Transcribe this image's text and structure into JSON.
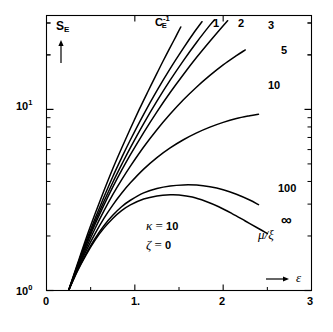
{
  "figure": {
    "background": "#ffffff",
    "ink_color": "#000000"
  },
  "axes": {
    "y_axis_name": "S",
    "y_axis_name_sub": "E",
    "y_axis_arrow": "↑",
    "x_axis_arrow": "→",
    "x_axis_name": "ε",
    "x_ticks": [
      "0",
      "1.",
      "2",
      "3"
    ],
    "y_ticks": [
      "10",
      "10"
    ],
    "y_tick_exponents": [
      "0",
      "1"
    ]
  },
  "annotations": {
    "kappa_line": "κ",
    "kappa_eq": " = ",
    "kappa_value": "10",
    "zeta_line": "ζ",
    "zeta_eq": " = ",
    "zeta_value": "0",
    "family_label_mu": "μ",
    "family_label_slash": "/",
    "family_label_xi": "ξ"
  },
  "curve_labels": {
    "ce_inv_base": "C",
    "ce_inv_sub": "E",
    "ce_inv_sup": "-1",
    "one": "1",
    "two": "2",
    "three": "3",
    "five": "5",
    "ten": "10",
    "hundred": "100",
    "infinity": "∞"
  },
  "chart_data": {
    "type": "line",
    "title": "",
    "xlabel": "ε",
    "ylabel": "S_E",
    "xscale": "linear",
    "yscale": "log",
    "xlim": [
      0,
      3
    ],
    "ylim": [
      1,
      33
    ],
    "grid": false,
    "legend": "inline curve end labels",
    "x_tick_values": [
      0,
      1,
      2,
      3
    ],
    "y_tick_values": [
      1,
      10
    ],
    "parameters": {
      "kappa": 10,
      "zeta": 0,
      "family_variable": "mu/xi"
    },
    "common_origin": {
      "x": 0.25,
      "y": 1.0
    },
    "series": [
      {
        "name": "C_E^-1",
        "label": "C_E^{-1}",
        "mu_over_xi": null,
        "points": [
          [
            0.25,
            1.0
          ],
          [
            0.35,
            1.4
          ],
          [
            0.45,
            1.95
          ],
          [
            0.55,
            2.65
          ],
          [
            0.65,
            3.55
          ],
          [
            0.75,
            4.7
          ],
          [
            0.85,
            6.1
          ],
          [
            0.95,
            7.85
          ],
          [
            1.05,
            10.0
          ],
          [
            1.15,
            12.6
          ],
          [
            1.25,
            15.8
          ],
          [
            1.32,
            18.5
          ],
          [
            1.4,
            22.0
          ],
          [
            1.46,
            25.0
          ],
          [
            1.52,
            28.5
          ]
        ]
      },
      {
        "name": "1",
        "label": "1",
        "mu_over_xi": 1,
        "points": [
          [
            0.25,
            1.0
          ],
          [
            0.35,
            1.38
          ],
          [
            0.45,
            1.88
          ],
          [
            0.55,
            2.5
          ],
          [
            0.65,
            3.28
          ],
          [
            0.75,
            4.25
          ],
          [
            0.85,
            5.4
          ],
          [
            0.95,
            6.8
          ],
          [
            1.1,
            9.4
          ],
          [
            1.25,
            12.7
          ],
          [
            1.4,
            16.8
          ],
          [
            1.55,
            21.8
          ],
          [
            1.68,
            27.0
          ],
          [
            1.76,
            30.5
          ]
        ]
      },
      {
        "name": "2",
        "label": "2",
        "mu_over_xi": 2,
        "points": [
          [
            0.25,
            1.0
          ],
          [
            0.35,
            1.36
          ],
          [
            0.45,
            1.82
          ],
          [
            0.55,
            2.4
          ],
          [
            0.65,
            3.1
          ],
          [
            0.75,
            3.95
          ],
          [
            0.85,
            4.95
          ],
          [
            0.95,
            6.15
          ],
          [
            1.1,
            8.35
          ],
          [
            1.25,
            11.1
          ],
          [
            1.4,
            14.5
          ],
          [
            1.55,
            18.6
          ],
          [
            1.7,
            23.5
          ],
          [
            1.85,
            29.2
          ],
          [
            1.9,
            31.2
          ]
        ]
      },
      {
        "name": "3",
        "label": "3",
        "mu_over_xi": 3,
        "points": [
          [
            0.25,
            1.0
          ],
          [
            0.35,
            1.35
          ],
          [
            0.45,
            1.78
          ],
          [
            0.55,
            2.32
          ],
          [
            0.65,
            2.96
          ],
          [
            0.75,
            3.72
          ],
          [
            0.85,
            4.6
          ],
          [
            0.95,
            5.62
          ],
          [
            1.1,
            7.45
          ],
          [
            1.25,
            9.7
          ],
          [
            1.4,
            12.4
          ],
          [
            1.55,
            15.6
          ],
          [
            1.7,
            19.4
          ],
          [
            1.85,
            23.8
          ],
          [
            2.0,
            29.0
          ],
          [
            2.05,
            30.9
          ]
        ]
      },
      {
        "name": "5",
        "label": "5",
        "mu_over_xi": 5,
        "points": [
          [
            0.25,
            1.0
          ],
          [
            0.35,
            1.33
          ],
          [
            0.45,
            1.72
          ],
          [
            0.55,
            2.2
          ],
          [
            0.65,
            2.75
          ],
          [
            0.75,
            3.38
          ],
          [
            0.85,
            4.08
          ],
          [
            0.95,
            4.86
          ],
          [
            1.1,
            6.2
          ],
          [
            1.25,
            7.72
          ],
          [
            1.4,
            9.42
          ],
          [
            1.55,
            11.3
          ],
          [
            1.7,
            13.3
          ],
          [
            1.85,
            15.4
          ],
          [
            2.0,
            17.6
          ],
          [
            2.15,
            19.8
          ],
          [
            2.25,
            21.3
          ]
        ]
      },
      {
        "name": "10",
        "label": "10",
        "mu_over_xi": 10,
        "points": [
          [
            0.25,
            1.0
          ],
          [
            0.35,
            1.31
          ],
          [
            0.45,
            1.66
          ],
          [
            0.55,
            2.06
          ],
          [
            0.65,
            2.5
          ],
          [
            0.75,
            2.96
          ],
          [
            0.85,
            3.44
          ],
          [
            0.95,
            3.93
          ],
          [
            1.1,
            4.68
          ],
          [
            1.25,
            5.42
          ],
          [
            1.4,
            6.13
          ],
          [
            1.55,
            6.8
          ],
          [
            1.7,
            7.42
          ],
          [
            1.85,
            7.98
          ],
          [
            2.0,
            8.48
          ],
          [
            2.15,
            8.9
          ],
          [
            2.3,
            9.22
          ],
          [
            2.4,
            9.4
          ]
        ]
      },
      {
        "name": "100",
        "label": "100",
        "mu_over_xi": 100,
        "points": [
          [
            0.25,
            1.0
          ],
          [
            0.35,
            1.29
          ],
          [
            0.45,
            1.6
          ],
          [
            0.55,
            1.94
          ],
          [
            0.65,
            2.28
          ],
          [
            0.75,
            2.6
          ],
          [
            0.85,
            2.9
          ],
          [
            0.95,
            3.15
          ],
          [
            1.1,
            3.46
          ],
          [
            1.25,
            3.66
          ],
          [
            1.4,
            3.78
          ],
          [
            1.55,
            3.83
          ],
          [
            1.7,
            3.82
          ],
          [
            1.85,
            3.74
          ],
          [
            2.0,
            3.6
          ],
          [
            2.15,
            3.4
          ],
          [
            2.3,
            3.16
          ],
          [
            2.4,
            2.98
          ]
        ]
      },
      {
        "name": "infinity",
        "label": "∞",
        "mu_over_xi": "∞",
        "points": [
          [
            0.25,
            1.0
          ],
          [
            0.35,
            1.28
          ],
          [
            0.45,
            1.58
          ],
          [
            0.55,
            1.9
          ],
          [
            0.65,
            2.21
          ],
          [
            0.75,
            2.5
          ],
          [
            0.85,
            2.76
          ],
          [
            0.95,
            2.97
          ],
          [
            1.1,
            3.2
          ],
          [
            1.25,
            3.33
          ],
          [
            1.4,
            3.38
          ],
          [
            1.5,
            3.37
          ],
          [
            1.65,
            3.28
          ],
          [
            1.8,
            3.11
          ],
          [
            1.95,
            2.9
          ],
          [
            2.1,
            2.66
          ],
          [
            2.25,
            2.42
          ],
          [
            2.4,
            2.2
          ],
          [
            2.5,
            2.06
          ]
        ]
      }
    ]
  }
}
